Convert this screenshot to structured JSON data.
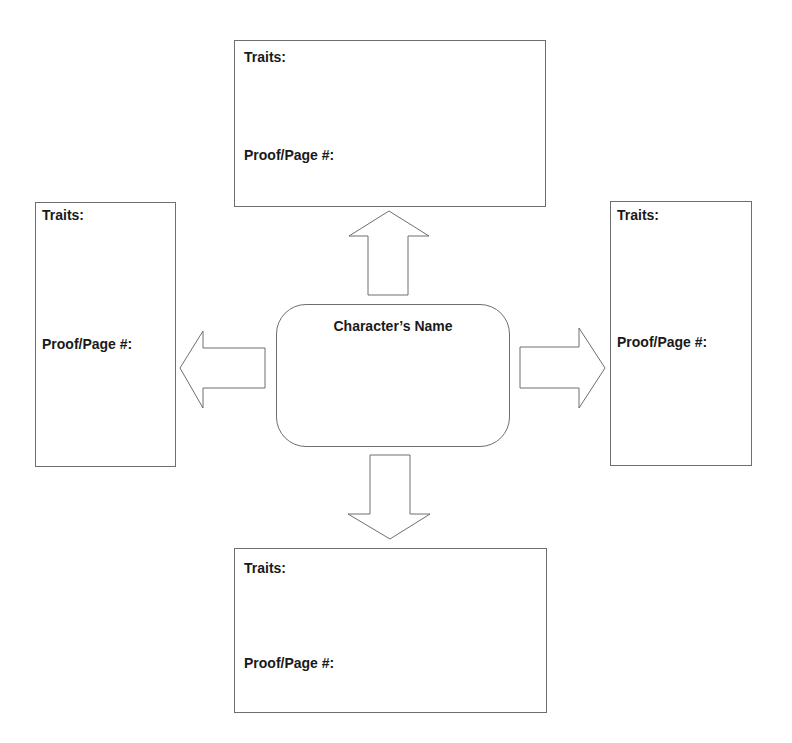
{
  "center": {
    "title": "Character’s Name"
  },
  "boxes": {
    "top": {
      "traits_label": "Traits:",
      "proof_label": "Proof/Page #:"
    },
    "left": {
      "traits_label": "Traits:",
      "proof_label": "Proof/Page #:"
    },
    "right": {
      "traits_label": "Traits:",
      "proof_label": "Proof/Page #:"
    },
    "bottom": {
      "traits_label": "Traits:",
      "proof_label": "Proof/Page #:"
    }
  },
  "arrows": [
    "up-arrow-icon",
    "left-arrow-icon",
    "right-arrow-icon",
    "down-arrow-icon"
  ],
  "colors": {
    "stroke": "#6e6e6e",
    "text": "#1a1a1a",
    "background": "#ffffff"
  }
}
